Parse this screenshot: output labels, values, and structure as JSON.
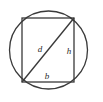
{
  "figure": {
    "background_color": "#ffffff",
    "stroke_color": "#3a3a3a",
    "label_color": "#2b2b2b",
    "circle": {
      "name": "circumscribed-circle",
      "center_x": 48.5,
      "center_y": 50,
      "radius": 39
    },
    "rectangle": {
      "name": "inscribed-rectangle",
      "left": 22,
      "top": 18,
      "right": 74,
      "bottom": 82,
      "width": 52,
      "height": 64
    },
    "diagonal": {
      "name": "rectangle-diagonal",
      "x1": 22,
      "y1": 82,
      "x2": 74,
      "y2": 18
    },
    "labels": [
      {
        "id": "label-d",
        "text": "d",
        "meaning": "diagonal",
        "x": 40,
        "y": 52
      },
      {
        "id": "label-h",
        "text": "h",
        "meaning": "height",
        "x": 69,
        "y": 54
      },
      {
        "id": "label-b",
        "text": "b",
        "meaning": "base",
        "x": 47,
        "y": 79
      }
    ]
  }
}
